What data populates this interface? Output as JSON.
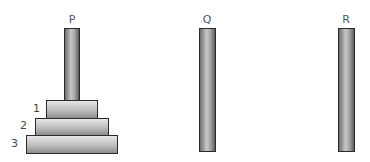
{
  "diagram": {
    "type": "tower-of-hanoi",
    "pegs": [
      {
        "label": "P",
        "disks": [
          1,
          2,
          3
        ]
      },
      {
        "label": "Q",
        "disks": []
      },
      {
        "label": "R",
        "disks": []
      }
    ],
    "disks": [
      {
        "number": "1"
      },
      {
        "number": "2"
      },
      {
        "number": "3"
      }
    ]
  }
}
